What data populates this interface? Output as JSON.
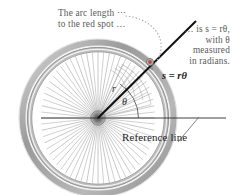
{
  "figure": {
    "background_color": "#ffffff"
  },
  "annotations": {
    "arc_length_note": "The arc length ⋯\nto the red spot …",
    "radian_note": "… is s = rθ,\nwith θ\nmeasured\nin radians.",
    "reference_line_label": "Reference line"
  },
  "labels": {
    "arc_formula": "s = rθ",
    "radius": "r",
    "angle": "θ"
  },
  "colors": {
    "annotation_text": "#5a5a5a",
    "label_text": "#1f1f1f",
    "red_spot": "#c0392b",
    "rim_dark": "#8a8a8a",
    "rim_light": "#c9c9c9",
    "spoke": "#9a9a9a",
    "radius_line": "#111111",
    "leader": "#9b9b9b"
  },
  "geometry": {
    "hub_center": [
      98,
      118
    ],
    "rim_outer_radius": 74,
    "spoke_count": 36,
    "radius_line_end": [
      196,
      21
    ],
    "red_spot": [
      150,
      62
    ],
    "reference_line_y": 118,
    "reference_line_x_end": 226
  }
}
